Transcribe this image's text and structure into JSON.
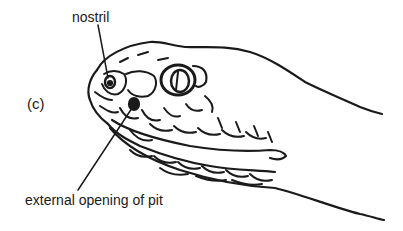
{
  "figure": {
    "panel_label": "(c)",
    "labels": {
      "nostril": "nostril",
      "pit": "external opening of pit"
    }
  },
  "colors": {
    "ink": "#1a1a1a",
    "background": "#ffffff"
  }
}
